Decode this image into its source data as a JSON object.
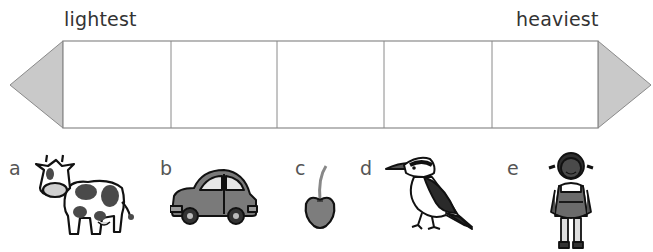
{
  "scale": {
    "left_label": "lightest",
    "right_label": "heaviest",
    "box_count": 5,
    "arrow_fill": "#c9c9c9",
    "line_color": "#8a8a8a"
  },
  "items": [
    {
      "letter": "a",
      "picture": "cow-icon"
    },
    {
      "letter": "b",
      "picture": "car-icon"
    },
    {
      "letter": "c",
      "picture": "cherry-icon"
    },
    {
      "letter": "d",
      "picture": "bird-icon"
    },
    {
      "letter": "e",
      "picture": "girl-icon"
    }
  ]
}
